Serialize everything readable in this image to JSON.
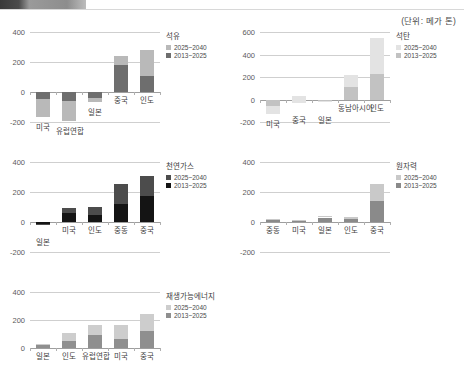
{
  "topbar": {
    "chip_label": ""
  },
  "unit_note": "(단위: 메가 톤)",
  "legend": {
    "later_label": "2025~2040",
    "earlier_label": "2013~2025"
  },
  "chart_data": [
    {
      "id": "oil",
      "type": "bar",
      "title": "석유",
      "categories": [
        "미국",
        "유럽연합",
        "일본",
        "중국",
        "인도"
      ],
      "series": [
        {
          "name": "2013~2025",
          "values": [
            -48,
            -62,
            -38,
            178,
            105
          ]
        },
        {
          "name": "2025~2040",
          "values": [
            -118,
            -130,
            -30,
            60,
            175
          ]
        }
      ],
      "stacked": true,
      "ylim": [
        -200,
        400
      ],
      "yticks": [
        -200,
        0,
        200,
        400
      ],
      "ytick_labels": [
        "-200",
        "0",
        "200",
        "400"
      ],
      "grid": true,
      "xlabel": "",
      "ylabel": "",
      "colors": {
        "earlier": "#6e6e6e",
        "later": "#b9b9b9"
      }
    },
    {
      "id": "coal",
      "type": "bar",
      "title": "석탄",
      "categories": [
        "미국",
        "중국",
        "일본",
        "동남아시아",
        "인도"
      ],
      "series": [
        {
          "name": "2013~2025",
          "values": [
            -60,
            35,
            -10,
            110,
            225
          ]
        },
        {
          "name": "2025~2040",
          "values": [
            -65,
            -70,
            -10,
            110,
            325
          ]
        }
      ],
      "stacked": true,
      "ylim": [
        -200,
        600
      ],
      "yticks": [
        -200,
        0,
        200,
        400,
        600
      ],
      "ytick_labels": [
        "-200",
        "0",
        "200",
        "400",
        "600"
      ],
      "grid": true,
      "xlabel": "",
      "ylabel": "",
      "colors": {
        "earlier": "#c2c2c2",
        "later": "#e3e3e3"
      }
    },
    {
      "id": "gas",
      "type": "bar",
      "title": "천연가스",
      "categories": [
        "일본",
        "미국",
        "인도",
        "중동",
        "중국"
      ],
      "series": [
        {
          "name": "2013~2025",
          "values": [
            -12,
            58,
            45,
            120,
            175
          ]
        },
        {
          "name": "2025~2040",
          "values": [
            0,
            38,
            58,
            135,
            130
          ]
        }
      ],
      "stacked": true,
      "ylim": [
        -200,
        400
      ],
      "yticks": [
        -200,
        0,
        200,
        400
      ],
      "ytick_labels": [
        "-200",
        "0",
        "200",
        "400"
      ],
      "grid": true,
      "xlabel": "",
      "ylabel": "",
      "colors": {
        "earlier": "#141414",
        "later": "#4c4c4c"
      }
    },
    {
      "id": "nuclear",
      "type": "bar",
      "title": "원자력",
      "categories": [
        "중동",
        "미국",
        "일본",
        "인도",
        "중국"
      ],
      "series": [
        {
          "name": "2013~2025",
          "values": [
            12,
            10,
            30,
            22,
            140
          ]
        },
        {
          "name": "2025~2040",
          "values": [
            8,
            6,
            8,
            12,
            115
          ]
        }
      ],
      "stacked": true,
      "ylim": [
        -200,
        400
      ],
      "yticks": [
        -200,
        0,
        200,
        400
      ],
      "ytick_labels": [
        "-200",
        "0",
        "200",
        "400"
      ],
      "grid": true,
      "xlabel": "",
      "ylabel": "",
      "colors": {
        "earlier": "#8a8a8a",
        "later": "#c9c9c9"
      }
    },
    {
      "id": "renewable",
      "type": "bar",
      "title": "재생가능에너지",
      "categories": [
        "일본",
        "인도",
        "유럽연합",
        "미국",
        "중국"
      ],
      "series": [
        {
          "name": "2013~2025",
          "values": [
            18,
            52,
            92,
            62,
            118
          ]
        },
        {
          "name": "2025~2040",
          "values": [
            12,
            58,
            72,
            100,
            122
          ]
        }
      ],
      "stacked": true,
      "ylim": [
        0,
        400
      ],
      "yticks": [
        0,
        200,
        400
      ],
      "ytick_labels": [
        "0",
        "200",
        "400"
      ],
      "grid": true,
      "xlabel": "",
      "ylabel": "",
      "colors": {
        "earlier": "#8f8f8f",
        "later": "#cdcdcd"
      }
    }
  ],
  "panels": [
    {
      "id": "oil",
      "left": 4,
      "top": 24,
      "width": 228,
      "height": 118
    },
    {
      "id": "coal",
      "left": 234,
      "top": 24,
      "width": 228,
      "height": 118
    },
    {
      "id": "gas",
      "left": 4,
      "top": 154,
      "width": 228,
      "height": 118
    },
    {
      "id": "nuclear",
      "left": 234,
      "top": 154,
      "width": 228,
      "height": 118
    },
    {
      "id": "renewable",
      "left": 4,
      "top": 284,
      "width": 228,
      "height": 84
    }
  ]
}
